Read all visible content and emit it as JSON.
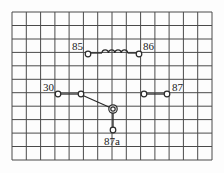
{
  "diagram": {
    "grid": {
      "columns": 14,
      "rows": 11,
      "x0": 12,
      "y0": 12,
      "x1": 212,
      "y1": 160
    },
    "colors": {
      "background": "#fdfdfd",
      "grid": "#4a4a4a",
      "wire": "#2a2a2a"
    },
    "coil": {
      "label_left": "85",
      "label_right": "86",
      "loops": 4
    },
    "switch": {
      "common_label": "30",
      "normally_open_label": "87",
      "normally_closed_label": "87a"
    }
  }
}
